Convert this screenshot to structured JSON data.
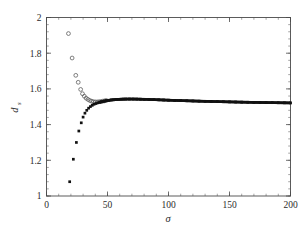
{
  "chart_data": {
    "type": "scatter",
    "title": "",
    "xlabel": "σ",
    "ylabel": "d_s",
    "ylabel_base": "d",
    "ylabel_sub": "s",
    "xlim": [
      0,
      200
    ],
    "ylim": [
      1,
      2
    ],
    "grid": false,
    "legend": null,
    "xticks": [
      0,
      50,
      100,
      150,
      200
    ],
    "xtick_labels": [
      "0",
      "50",
      "100",
      "150",
      "200"
    ],
    "yticks": [
      1,
      1.2,
      1.4,
      1.6,
      1.8,
      2
    ],
    "ytick_labels": [
      "1",
      "1.2",
      "1.4",
      "1.6",
      "1.8",
      "2"
    ],
    "x_minor_step": 10,
    "y_minor_step": 0.04,
    "series": [
      {
        "name": "upper-branch-open-circles",
        "marker": "open-circle",
        "color": "#555555",
        "points": [
          [
            18,
            1.91
          ],
          [
            21,
            1.773
          ],
          [
            24,
            1.676
          ],
          [
            26,
            1.637
          ],
          [
            28,
            1.597
          ],
          [
            29.5,
            1.573
          ],
          [
            31,
            1.559
          ],
          [
            32.5,
            1.548
          ],
          [
            34,
            1.541
          ],
          [
            35.5,
            1.535
          ],
          [
            37,
            1.531
          ],
          [
            38.5,
            1.528
          ],
          [
            40,
            1.527
          ],
          [
            41.5,
            1.527
          ],
          [
            43,
            1.528
          ],
          [
            44.5,
            1.529
          ],
          [
            46,
            1.531
          ],
          [
            47.5,
            1.533
          ],
          [
            49,
            1.535
          ]
        ]
      },
      {
        "name": "lower-branch-filled-squares",
        "marker": "filled-square",
        "color": "#111111",
        "points": [
          [
            19,
            1.08
          ],
          [
            22,
            1.206
          ],
          [
            24.5,
            1.3
          ],
          [
            26.5,
            1.364
          ],
          [
            28.5,
            1.41
          ],
          [
            30,
            1.442
          ],
          [
            31.5,
            1.464
          ],
          [
            33,
            1.48
          ],
          [
            34.5,
            1.492
          ],
          [
            36,
            1.501
          ],
          [
            37.5,
            1.508
          ],
          [
            39,
            1.514
          ],
          [
            40.5,
            1.518
          ],
          [
            42,
            1.522
          ],
          [
            43.5,
            1.525
          ],
          [
            45,
            1.528
          ],
          [
            47,
            1.531
          ],
          [
            49,
            1.534
          ],
          [
            51,
            1.536
          ],
          [
            53,
            1.538
          ],
          [
            55,
            1.539
          ],
          [
            57,
            1.5405
          ],
          [
            59,
            1.5415
          ],
          [
            61,
            1.5422
          ],
          [
            63,
            1.5427
          ],
          [
            65,
            1.543
          ],
          [
            68,
            1.5432
          ],
          [
            71,
            1.5431
          ],
          [
            74,
            1.5428
          ],
          [
            77,
            1.5423
          ],
          [
            80,
            1.5417
          ],
          [
            84,
            1.5408
          ],
          [
            88,
            1.5398
          ],
          [
            92,
            1.5388
          ],
          [
            96,
            1.5378
          ],
          [
            100,
            1.5368
          ],
          [
            105,
            1.5356
          ],
          [
            110,
            1.5345
          ],
          [
            115,
            1.5334
          ],
          [
            120,
            1.5324
          ],
          [
            125,
            1.5314
          ],
          [
            130,
            1.5305
          ],
          [
            135,
            1.5296
          ],
          [
            140,
            1.5288
          ],
          [
            145,
            1.528
          ],
          [
            150,
            1.5272
          ],
          [
            155,
            1.5265
          ],
          [
            160,
            1.5258
          ],
          [
            165,
            1.5252
          ],
          [
            170,
            1.5246
          ],
          [
            175,
            1.524
          ],
          [
            180,
            1.5234
          ],
          [
            185,
            1.5229
          ],
          [
            190,
            1.5224
          ],
          [
            195,
            1.522
          ],
          [
            200,
            1.5215
          ]
        ]
      }
    ]
  }
}
